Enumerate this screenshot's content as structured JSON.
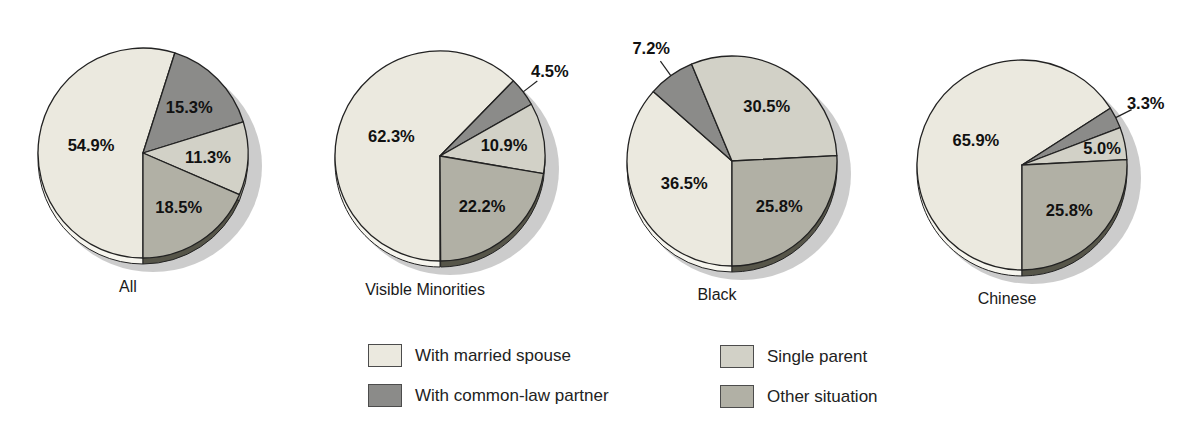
{
  "colors": {
    "married": "#ebe9df",
    "common_law": "#8b8b89",
    "single_parent": "#d2d1c7",
    "other": "#b1b0a5",
    "outline": "#222222",
    "shadow": "#c7c7c7",
    "label_text": "#111111",
    "depth": {
      "married": "#f6f5ee",
      "common_law": "#4e4e4c",
      "single_parent": "#8e8d82",
      "other": "#565549"
    }
  },
  "legend": {
    "items": [
      {
        "key": "married",
        "label": "With married spouse"
      },
      {
        "key": "common_law",
        "label": "With common-law partner"
      },
      {
        "key": "single_parent",
        "label": "Single parent"
      },
      {
        "key": "other",
        "label": "Other situation"
      }
    ]
  },
  "chart_data": {
    "type": "pie",
    "unit": "%",
    "categories": [
      "With married spouse",
      "With common-law partner",
      "Single parent",
      "Other situation"
    ],
    "category_keys": [
      "married",
      "common_law",
      "single_parent",
      "other"
    ],
    "direction": "clockwise",
    "start_angle_deg_cw_from_top": 180,
    "radius": 105,
    "pies": [
      {
        "title": "All",
        "values": [
          54.9,
          15.3,
          11.3,
          18.5
        ],
        "labels": [
          "54.9%",
          "15.3%",
          "11.3%",
          "18.5%"
        ],
        "outside_label_indices": [],
        "cx": 143,
        "cy": 153
      },
      {
        "title": "Visible Minorities",
        "values": [
          62.3,
          4.5,
          10.9,
          22.2
        ],
        "labels": [
          "62.3%",
          "4.5%",
          "10.9%",
          "22.2%"
        ],
        "outside_label_indices": [
          1
        ],
        "cx": 440,
        "cy": 156
      },
      {
        "title": "Black",
        "values": [
          36.5,
          7.2,
          30.5,
          25.8
        ],
        "labels": [
          "36.5%",
          "7.2%",
          "30.5%",
          "25.8%"
        ],
        "outside_label_indices": [
          1
        ],
        "cx": 732,
        "cy": 161
      },
      {
        "title": "Chinese",
        "values": [
          65.9,
          3.3,
          5.0,
          25.8
        ],
        "labels": [
          "65.9%",
          "3.3%",
          "5.0%",
          "25.8%"
        ],
        "outside_label_indices": [
          1
        ],
        "label_r_overrides": {
          "2": 0.78
        },
        "cx": 1022,
        "cy": 165
      }
    ]
  }
}
